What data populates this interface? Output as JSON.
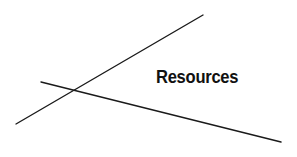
{
  "diagram": {
    "label": "Resources",
    "stroke_color": "#1a1a1a",
    "lines": [
      {
        "x1": 16,
        "y1": 124,
        "x2": 203,
        "y2": 15
      },
      {
        "x1": 41,
        "y1": 82,
        "x2": 281,
        "y2": 142
      }
    ]
  }
}
